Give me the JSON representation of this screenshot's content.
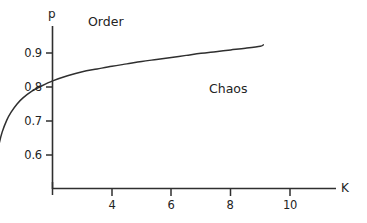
{
  "chart_data": {
    "type": "line",
    "title": "",
    "xlabel": "K",
    "ylabel": "p",
    "xlim": [
      0,
      11.5
    ],
    "ylim": [
      0.52,
      0.97
    ],
    "grid": false,
    "legend": "none",
    "xticks": [
      4,
      6,
      8,
      10
    ],
    "xticklabels": [
      "4",
      "6",
      "8",
      "10"
    ],
    "yticks": [
      0.6,
      0.7,
      0.8,
      0.9
    ],
    "yticklabels": [
      "0.6",
      "0.7",
      "0.8",
      "0.9"
    ],
    "series": [
      {
        "name": "order-chaos-boundary",
        "color": "#2f2f2f",
        "x": [
          0.02,
          0.06,
          0.12,
          0.2,
          0.3,
          0.45,
          0.6,
          0.8,
          1.0,
          1.3,
          1.6,
          2.0,
          2.5,
          3.0,
          3.5,
          4.0,
          4.5,
          5.0,
          5.5,
          6.0,
          6.5,
          7.0,
          7.5,
          8.0,
          8.5,
          9.0,
          9.1
        ],
        "y": [
          0.545,
          0.565,
          0.6,
          0.635,
          0.668,
          0.702,
          0.726,
          0.75,
          0.768,
          0.788,
          0.802,
          0.818,
          0.833,
          0.845,
          0.853,
          0.861,
          0.868,
          0.875,
          0.881,
          0.887,
          0.893,
          0.899,
          0.904,
          0.909,
          0.914,
          0.92,
          0.924
        ]
      }
    ],
    "annotations": [
      {
        "name": "order-region-label",
        "text": "Order",
        "x": 1.95,
        "y": 0.948
      },
      {
        "name": "chaos-region-label",
        "text": "Chaos",
        "x": 6.05,
        "y": 0.842
      }
    ]
  },
  "axis_labels": {
    "y": "p",
    "x": "K"
  },
  "colors": {
    "axis": "#2f2f2f",
    "curve": "#2f2f2f",
    "text": "#232323",
    "background": "#ffffff"
  }
}
